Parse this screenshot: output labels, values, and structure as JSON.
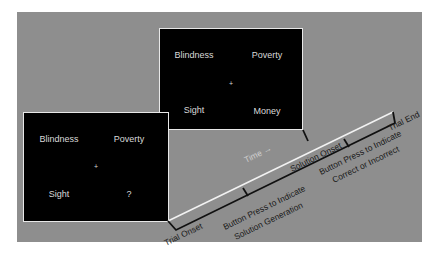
{
  "diagram": {
    "title": "",
    "background_color": "#8e8e8e",
    "panels": {
      "generation": {
        "top_left": "Blindness",
        "top_right": "Poverty",
        "center": "+",
        "bottom_left": "Sight",
        "bottom_right": "?"
      },
      "solution": {
        "top_left": "Blindness",
        "top_right": "Poverty",
        "center": "+",
        "bottom_left": "Sight",
        "bottom_right": "Money"
      }
    },
    "timeline": {
      "time_label": "Time →",
      "events": {
        "trial_onset": "Trial Onset",
        "button_press_1_line1": "Button Press to Indicate",
        "button_press_1_line2": "Solution Generation",
        "solution_onset": "Solution Onset",
        "button_press_2_line1": "Button Press to Indicate",
        "button_press_2_line2": "Correct or Incorrect",
        "trial_end": "Trial End"
      }
    }
  }
}
